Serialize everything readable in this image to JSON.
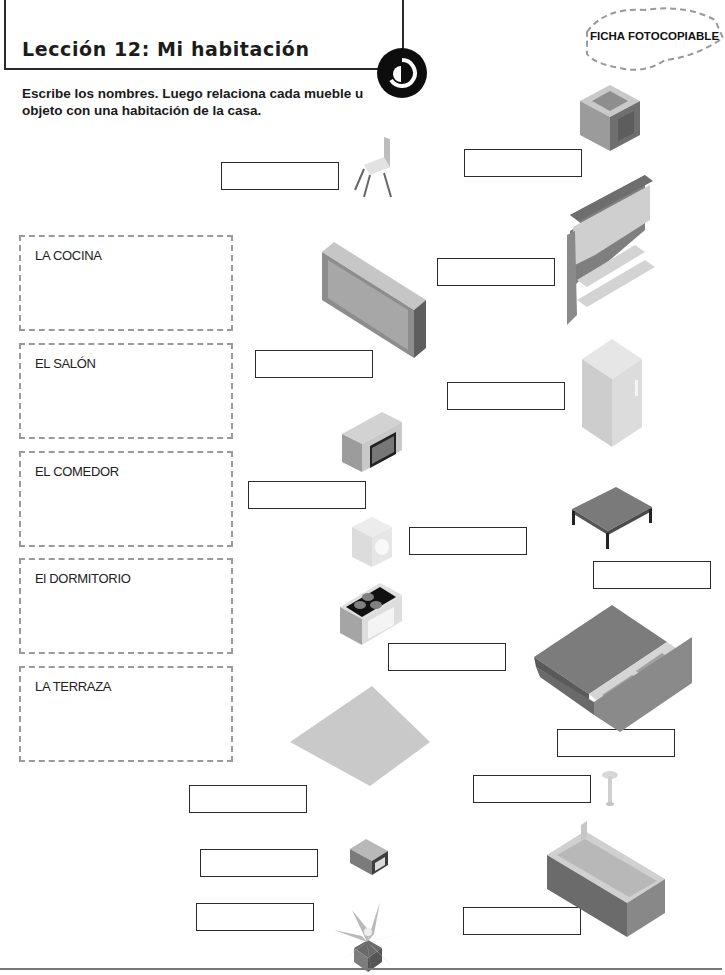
{
  "header": {
    "title": "Lección 12: Mi habitación",
    "badge": "FICHA FOTOCOPIABLE",
    "logo_icon": "publisher-logo-icon"
  },
  "instructions": "Escribe los nombres. Luego relaciona cada mueble u objeto con una habitación de la casa.",
  "rooms": [
    {
      "label": "LA COCINA"
    },
    {
      "label": "EL SALÓN"
    },
    {
      "label": "EL COMEDOR"
    },
    {
      "label": "El DORMITORIO"
    },
    {
      "label": "LA TERRAZA"
    }
  ],
  "items": [
    {
      "icon": "chair-icon",
      "answer": ""
    },
    {
      "icon": "armchair-icon",
      "answer": ""
    },
    {
      "icon": "sideboard-icon",
      "answer": ""
    },
    {
      "icon": "wall-unit-icon",
      "answer": ""
    },
    {
      "icon": "fridge-icon",
      "answer": ""
    },
    {
      "icon": "microwave-icon",
      "answer": ""
    },
    {
      "icon": "table-icon",
      "answer": ""
    },
    {
      "icon": "washing-machine-icon",
      "answer": ""
    },
    {
      "icon": "cooker-icon",
      "answer": ""
    },
    {
      "icon": "bed-icon",
      "answer": ""
    },
    {
      "icon": "rug-icon",
      "answer": ""
    },
    {
      "icon": "lamp-icon",
      "answer": ""
    },
    {
      "icon": "television-icon",
      "answer": ""
    },
    {
      "icon": "sofa-icon",
      "answer": ""
    },
    {
      "icon": "plant-icon",
      "answer": ""
    }
  ],
  "colors": {
    "frame": "#2a2a2a",
    "dashed_border": "#9a9a9a",
    "furniture_light": "#d6d6d6",
    "furniture_mid": "#a8a8a8",
    "furniture_dark": "#7a7a7a"
  }
}
